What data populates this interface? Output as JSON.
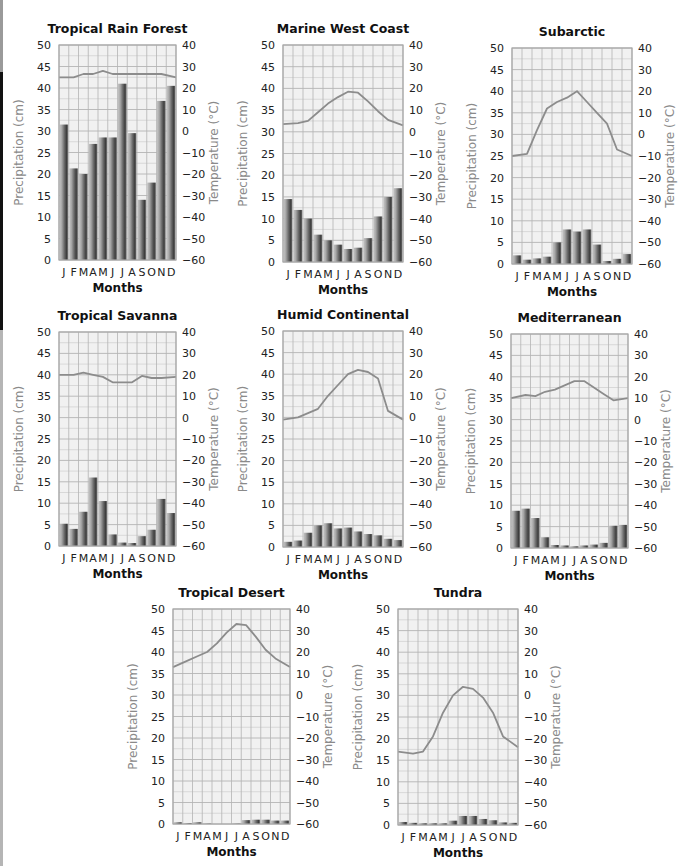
{
  "months": [
    "J",
    "F",
    "M",
    "A",
    "M",
    "J",
    "J",
    "A",
    "S",
    "O",
    "N",
    "D"
  ],
  "colors": {
    "plot_bg": "#f1f1f1",
    "grid_minor": "#c8c8c8",
    "grid_major": "#b4b4b4",
    "temp_line": "#8c8c8c",
    "bar_light": "#b8b8b8",
    "bar_dark": "#4a4a4a",
    "axis_title": "#8a8a8a"
  },
  "chart_data": [
    {
      "type": "bar+line",
      "title": "Tropical Rain Forest",
      "xlabel": "Months",
      "ylabel": "Precipitation (cm)",
      "y2label": "Temperature (°C)",
      "categories": [
        "J",
        "F",
        "M",
        "A",
        "M",
        "J",
        "J",
        "A",
        "S",
        "O",
        "N",
        "D"
      ],
      "ylim": [
        0,
        50
      ],
      "y2lim": [
        -60,
        40
      ],
      "yticks": [
        0,
        5,
        10,
        15,
        20,
        25,
        30,
        35,
        40,
        45,
        50
      ],
      "y2ticks": [
        -60,
        -50,
        -40,
        -30,
        -20,
        -10,
        0,
        10,
        20,
        30,
        40
      ],
      "grid": true,
      "series": [
        {
          "name": "Precipitation (cm)",
          "type": "bar",
          "values": [
            31.5,
            21.3,
            20,
            27,
            28.5,
            28.5,
            41,
            29.5,
            14,
            18,
            37,
            40.5
          ]
        },
        {
          "name": "Temperature (°C)",
          "type": "line",
          "values": [
            25,
            25,
            26.5,
            26.5,
            28,
            26.5,
            26.5,
            26.5,
            26.5,
            26.5,
            26.5,
            25
          ]
        }
      ]
    },
    {
      "type": "bar+line",
      "title": "Marine West Coast",
      "xlabel": "Months",
      "ylabel": "Precipitation (cm)",
      "y2label": "Temperature (°C)",
      "categories": [
        "J",
        "F",
        "M",
        "A",
        "M",
        "J",
        "J",
        "A",
        "S",
        "O",
        "N",
        "D"
      ],
      "ylim": [
        0,
        50
      ],
      "y2lim": [
        -60,
        40
      ],
      "yticks": [
        0,
        5,
        10,
        15,
        20,
        25,
        30,
        35,
        40,
        45,
        50
      ],
      "y2ticks": [
        -60,
        -50,
        -40,
        -30,
        -20,
        -10,
        0,
        10,
        20,
        30,
        40
      ],
      "grid": true,
      "series": [
        {
          "name": "Precipitation (cm)",
          "type": "bar",
          "values": [
            14.5,
            12,
            10,
            6.3,
            5,
            4,
            3,
            3.3,
            5.5,
            10.5,
            15,
            17
          ]
        },
        {
          "name": "Temperature (°C)",
          "type": "line",
          "values": [
            3.5,
            4,
            5,
            9,
            13,
            16,
            18.5,
            18,
            14,
            9.5,
            5.5,
            3
          ]
        }
      ]
    },
    {
      "type": "bar+line",
      "title": "Subarctic",
      "xlabel": "Months",
      "ylabel": "Precipitation (cm)",
      "y2label": "Temperature (°C)",
      "categories": [
        "J",
        "F",
        "M",
        "A",
        "M",
        "J",
        "J",
        "A",
        "S",
        "O",
        "N",
        "D"
      ],
      "ylim": [
        0,
        50
      ],
      "y2lim": [
        -60,
        40
      ],
      "yticks": [
        0,
        5,
        10,
        15,
        20,
        25,
        30,
        35,
        40,
        45,
        50
      ],
      "y2ticks": [
        -60,
        -50,
        -40,
        -30,
        -20,
        -10,
        0,
        10,
        20,
        30,
        40
      ],
      "grid": true,
      "series": [
        {
          "name": "Precipitation (cm)",
          "type": "bar",
          "values": [
            2,
            1,
            1.3,
            1.7,
            5,
            8,
            7.5,
            8,
            4.5,
            0.7,
            1.2,
            2.3
          ]
        },
        {
          "name": "Temperature (°C)",
          "type": "line",
          "values": [
            -10,
            -9,
            2,
            12,
            15,
            17,
            20,
            15,
            10,
            5,
            -7,
            -10
          ]
        }
      ]
    },
    {
      "type": "bar+line",
      "title": "Tropical Savanna",
      "xlabel": "Months",
      "ylabel": "Precipitation (cm)",
      "y2label": "Temperature (°C)",
      "categories": [
        "J",
        "F",
        "M",
        "A",
        "M",
        "J",
        "J",
        "A",
        "S",
        "O",
        "N",
        "D"
      ],
      "ylim": [
        0,
        50
      ],
      "y2lim": [
        -60,
        40
      ],
      "yticks": [
        0,
        5,
        10,
        15,
        20,
        25,
        30,
        35,
        40,
        45,
        50
      ],
      "y2ticks": [
        -60,
        -50,
        -40,
        -30,
        -20,
        -10,
        0,
        10,
        20,
        30,
        40
      ],
      "grid": true,
      "series": [
        {
          "name": "Precipitation (cm)",
          "type": "bar",
          "values": [
            5.2,
            4,
            8,
            16,
            10.5,
            2.7,
            0.8,
            0.7,
            2.3,
            3.8,
            11,
            7.7
          ]
        },
        {
          "name": "Temperature (°C)",
          "type": "line",
          "values": [
            20,
            20,
            21,
            20,
            19,
            16.5,
            16.5,
            16.5,
            19.5,
            18.5,
            18.5,
            19
          ]
        }
      ]
    },
    {
      "type": "bar+line",
      "title": "Humid Continental",
      "xlabel": "Months",
      "ylabel": "Precipitation (cm)",
      "y2label": "Temperature (°C)",
      "categories": [
        "J",
        "F",
        "M",
        "A",
        "M",
        "J",
        "J",
        "A",
        "S",
        "O",
        "N",
        "D"
      ],
      "ylim": [
        0,
        50
      ],
      "y2lim": [
        -60,
        40
      ],
      "yticks": [
        0,
        5,
        10,
        15,
        20,
        25,
        30,
        35,
        40,
        45,
        50
      ],
      "y2ticks": [
        -60,
        -50,
        -40,
        -30,
        -20,
        -10,
        0,
        10,
        20,
        30,
        40
      ],
      "grid": true,
      "series": [
        {
          "name": "Precipitation (cm)",
          "type": "bar",
          "values": [
            1.2,
            1.5,
            3.3,
            5,
            5.5,
            4.3,
            4.5,
            3.6,
            3,
            2.7,
            1.9,
            1.6
          ]
        },
        {
          "name": "Temperature (°C)",
          "type": "line",
          "values": [
            -1,
            0,
            2,
            4,
            10,
            15,
            20,
            22,
            21,
            18,
            3,
            -1
          ]
        }
      ]
    },
    {
      "type": "bar+line",
      "title": "Mediterranean",
      "xlabel": "Months",
      "ylabel": "Precipitation (cm)",
      "y2label": "Temperature (°C)",
      "categories": [
        "J",
        "F",
        "M",
        "A",
        "M",
        "J",
        "J",
        "A",
        "S",
        "O",
        "N",
        "D"
      ],
      "ylim": [
        0,
        50
      ],
      "y2lim": [
        -60,
        40
      ],
      "yticks": [
        0,
        5,
        10,
        15,
        20,
        25,
        30,
        35,
        40,
        45,
        50
      ],
      "y2ticks": [
        -60,
        -50,
        -40,
        -30,
        -20,
        -10,
        0,
        10,
        20,
        30,
        40
      ],
      "grid": true,
      "series": [
        {
          "name": "Precipitation (cm)",
          "type": "bar",
          "values": [
            8.7,
            9.2,
            7,
            2.5,
            0.7,
            0.6,
            0.4,
            0.6,
            0.8,
            1.2,
            5.2,
            5.4
          ]
        },
        {
          "name": "Temperature (°C)",
          "type": "line",
          "values": [
            10,
            11.5,
            11,
            13,
            14,
            16,
            18,
            18,
            15,
            12,
            9,
            10
          ]
        }
      ]
    },
    {
      "type": "bar+line",
      "title": "Tropical Desert",
      "xlabel": "Months",
      "ylabel": "Precipitation (cm)",
      "y2label": "Temperature (°C)",
      "categories": [
        "J",
        "F",
        "M",
        "A",
        "M",
        "J",
        "J",
        "A",
        "S",
        "O",
        "N",
        "D"
      ],
      "ylim": [
        0,
        50
      ],
      "y2lim": [
        -60,
        40
      ],
      "yticks": [
        0,
        5,
        10,
        15,
        20,
        25,
        30,
        35,
        40,
        45,
        50
      ],
      "y2ticks": [
        -60,
        -50,
        -40,
        -30,
        -20,
        -10,
        0,
        10,
        20,
        30,
        40
      ],
      "grid": true,
      "series": [
        {
          "name": "Precipitation (cm)",
          "type": "bar",
          "values": [
            0.4,
            0.2,
            0.4,
            0.1,
            0,
            0,
            0.1,
            0.9,
            1,
            1,
            0.8,
            0.8
          ]
        },
        {
          "name": "Temperature (°C)",
          "type": "line",
          "values": [
            13,
            16,
            18,
            20,
            24,
            29,
            33,
            32.5,
            27,
            21,
            17,
            13
          ]
        }
      ]
    },
    {
      "type": "bar+line",
      "title": "Tundra",
      "xlabel": "Months",
      "ylabel": "Precipitation (cm)",
      "y2label": "Temperature (°C)",
      "categories": [
        "J",
        "F",
        "M",
        "A",
        "M",
        "J",
        "J",
        "A",
        "S",
        "O",
        "N",
        "D"
      ],
      "ylim": [
        0,
        50
      ],
      "y2lim": [
        -60,
        40
      ],
      "yticks": [
        0,
        5,
        10,
        15,
        20,
        25,
        30,
        35,
        40,
        45,
        50
      ],
      "y2ticks": [
        -60,
        -50,
        -40,
        -30,
        -20,
        -10,
        0,
        10,
        20,
        30,
        40
      ],
      "grid": true,
      "series": [
        {
          "name": "Precipitation (cm)",
          "type": "bar",
          "values": [
            0.7,
            0.5,
            0.4,
            0.4,
            0.4,
            1,
            2.1,
            2.1,
            1.4,
            1.1,
            0.6,
            0.5
          ]
        },
        {
          "name": "Temperature (°C)",
          "type": "line",
          "values": [
            -26,
            -27,
            -26,
            -19,
            -8,
            0,
            4,
            3,
            -1,
            -8,
            -19,
            -24
          ]
        }
      ]
    }
  ],
  "layout": {
    "plots": [
      {
        "left": 59,
        "top": 45,
        "width": 117,
        "height": 215
      },
      {
        "left": 283,
        "top": 45,
        "width": 120,
        "height": 217
      },
      {
        "left": 512,
        "top": 48,
        "width": 120,
        "height": 216
      },
      {
        "left": 59,
        "top": 332,
        "width": 117,
        "height": 214
      },
      {
        "left": 283,
        "top": 331,
        "width": 120,
        "height": 216
      },
      {
        "left": 511,
        "top": 334,
        "width": 117,
        "height": 214
      },
      {
        "left": 173,
        "top": 609,
        "width": 117,
        "height": 215
      },
      {
        "left": 398,
        "top": 609,
        "width": 120,
        "height": 216
      }
    ]
  }
}
